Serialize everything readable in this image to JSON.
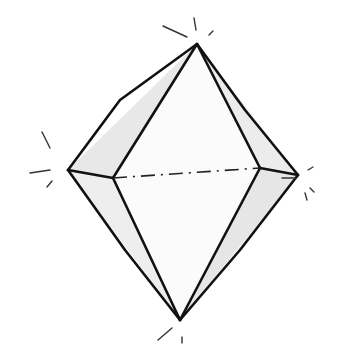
{
  "image": {
    "subject": "hand-drawn octahedron crystal sketch",
    "colors": {
      "stroke": "#111111",
      "shade": "#e6e6e6",
      "background": "#ffffff"
    }
  }
}
